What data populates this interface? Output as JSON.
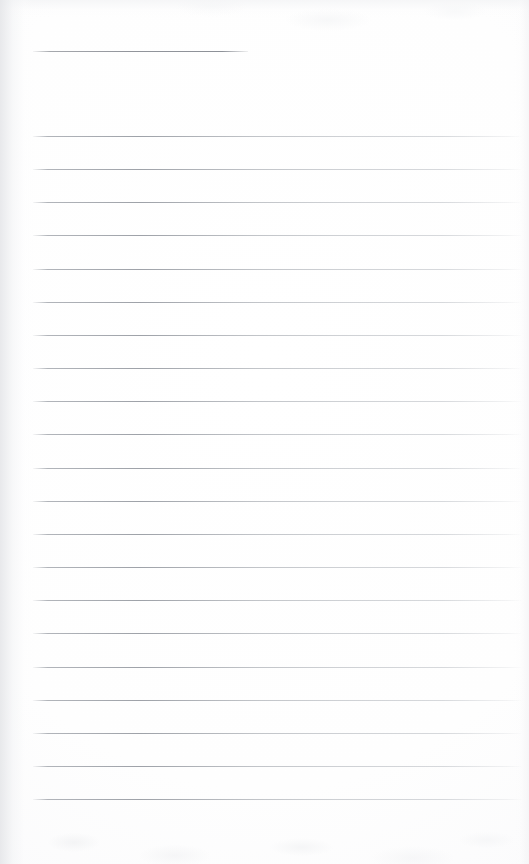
{
  "document": {
    "kind": "blank-ruled-notebook-page",
    "title": "",
    "body_text": "",
    "page_width": 529,
    "page_height": 864,
    "background_color": "#ffffff",
    "rule_color": "#9aa0a8",
    "text_content_present": false
  },
  "heading_rule": {
    "label": "",
    "x": 33,
    "y": 51,
    "width": 215
  },
  "body_rules": {
    "count": 21,
    "start_x": 33,
    "end_x": 521,
    "first_y": 136,
    "spacing": 33.15,
    "lines": [
      {
        "index": 1,
        "y": 136,
        "label": ""
      },
      {
        "index": 2,
        "y": 169,
        "label": ""
      },
      {
        "index": 3,
        "y": 202,
        "label": ""
      },
      {
        "index": 4,
        "y": 235,
        "label": ""
      },
      {
        "index": 5,
        "y": 269,
        "label": ""
      },
      {
        "index": 6,
        "y": 302,
        "label": ""
      },
      {
        "index": 7,
        "y": 335,
        "label": ""
      },
      {
        "index": 8,
        "y": 368,
        "label": ""
      },
      {
        "index": 9,
        "y": 401,
        "label": ""
      },
      {
        "index": 10,
        "y": 434,
        "label": ""
      },
      {
        "index": 11,
        "y": 468,
        "label": ""
      },
      {
        "index": 12,
        "y": 501,
        "label": ""
      },
      {
        "index": 13,
        "y": 534,
        "label": ""
      },
      {
        "index": 14,
        "y": 567,
        "label": ""
      },
      {
        "index": 15,
        "y": 600,
        "label": ""
      },
      {
        "index": 16,
        "y": 633,
        "label": ""
      },
      {
        "index": 17,
        "y": 667,
        "label": ""
      },
      {
        "index": 18,
        "y": 700,
        "label": ""
      },
      {
        "index": 19,
        "y": 733,
        "label": ""
      },
      {
        "index": 20,
        "y": 766,
        "label": ""
      },
      {
        "index": 21,
        "y": 799,
        "label": ""
      }
    ]
  },
  "footer_area": {
    "note": "",
    "blank_height": 65
  }
}
